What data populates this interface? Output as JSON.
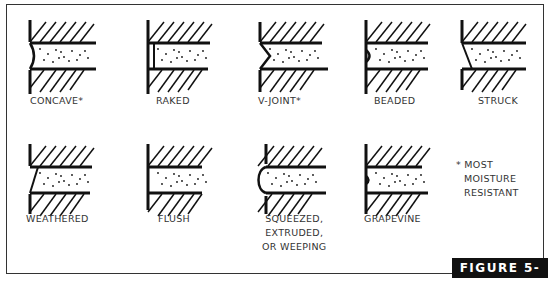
{
  "figure": {
    "label": "FIGURE 5-23",
    "note_lines": [
      "* MOST",
      "MOISTURE",
      "RESISTANT"
    ]
  },
  "joints": [
    {
      "name": "CONCAVE*",
      "profile": "concave"
    },
    {
      "name": "RAKED",
      "profile": "raked"
    },
    {
      "name": "V-JOINT*",
      "profile": "v-joint"
    },
    {
      "name": "BEADED",
      "profile": "beaded"
    },
    {
      "name": "STRUCK",
      "profile": "struck"
    },
    {
      "name": "WEATHERED",
      "profile": "weathered"
    },
    {
      "name": "FLUSH",
      "profile": "flush"
    },
    {
      "name_lines": [
        "SQUEEZED,",
        "EXTRUDED,",
        "OR WEEPING"
      ],
      "profile": "squeezed"
    },
    {
      "name": "GRAPEVINE",
      "profile": "grapevine"
    }
  ],
  "colors": {
    "ink": "#111111",
    "label_bg": "#111111",
    "label_text": "#ffffff"
  }
}
